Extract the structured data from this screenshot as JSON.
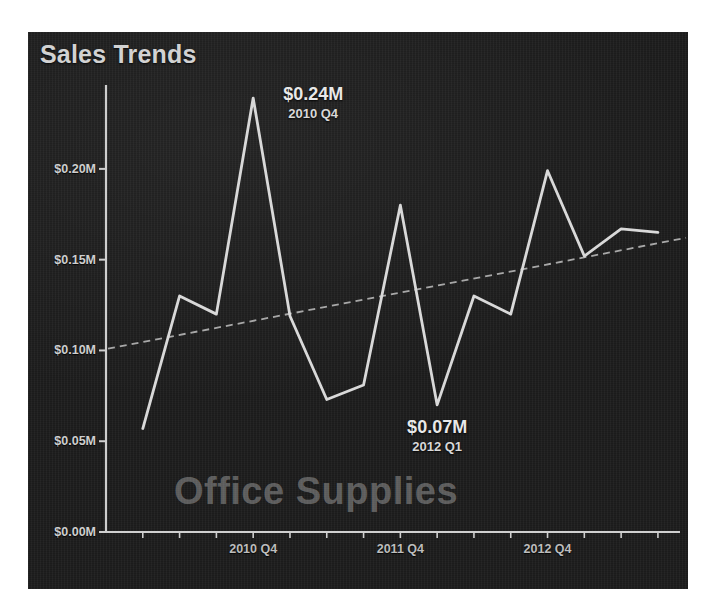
{
  "chart_data": {
    "type": "line",
    "title": "Sales Trends",
    "watermark": "Office Supplies",
    "xlabel": "",
    "ylabel": "",
    "ylim": [
      0,
      0.2462
    ],
    "grid": false,
    "legend": null,
    "y_ticks": [
      "$0.00M",
      "$0.05M",
      "$0.10M",
      "$0.15M",
      "$0.20M"
    ],
    "y_tick_values": [
      0.0,
      0.05,
      0.1,
      0.15,
      0.2
    ],
    "x_ticks": [
      "2010 Q4",
      "2011 Q4",
      "2012 Q4"
    ],
    "x_tick_index": [
      3,
      7,
      11
    ],
    "categories": [
      "2010 Q1",
      "2010 Q2",
      "2010 Q3",
      "2010 Q4",
      "2011 Q1",
      "2011 Q2",
      "2011 Q3",
      "2011 Q4",
      "2012 Q1",
      "2012 Q2",
      "2012 Q3",
      "2012 Q4",
      "2013 Q1",
      "2013 Q2",
      "2013 Q3"
    ],
    "series": [
      {
        "name": "Sales",
        "style": "solid",
        "color": "#d9d9d9",
        "values": [
          0.057,
          0.13,
          0.12,
          0.239,
          0.119,
          0.073,
          0.081,
          0.18,
          0.07,
          0.13,
          0.12,
          0.199,
          0.152,
          0.167,
          0.165
        ]
      },
      {
        "name": "Trend",
        "style": "dashed",
        "color": "#a8a8a8",
        "values": [
          0.101,
          0.106,
          0.111,
          0.115,
          0.12,
          0.124,
          0.129,
          0.133,
          0.138,
          0.142,
          0.147,
          0.151,
          0.156,
          0.16,
          0.162
        ]
      }
    ],
    "annotations": [
      {
        "value": "$0.24M",
        "period": "2010 Q4",
        "index": 3,
        "y": 0.239,
        "placement": "above-right"
      },
      {
        "value": "$0.07M",
        "period": "2012 Q1",
        "index": 8,
        "y": 0.07,
        "placement": "below"
      }
    ],
    "colors": {
      "panel_background": "#1b1b1b",
      "page_background": "#ffffff",
      "axis": "#cfcfcf",
      "title_text": "#d2d2d2",
      "tick_text": "#cfcfcf",
      "watermark_text": "rgba(255,255,255,0.30)"
    }
  }
}
